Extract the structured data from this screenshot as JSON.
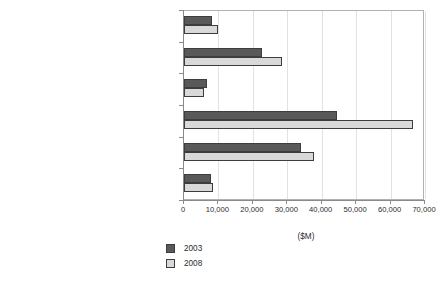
{
  "chart_data": {
    "type": "bar",
    "orientation": "horizontal",
    "title": "",
    "xlabel": "($M)",
    "ylabel": "",
    "xlim": [
      0,
      70000
    ],
    "xticks": [
      0,
      10000,
      20000,
      30000,
      40000,
      50000,
      60000,
      70000
    ],
    "xtick_labels": [
      "0",
      "10,000",
      "20,000",
      "30,000",
      "40,000",
      "50,000",
      "60,000",
      "70,000"
    ],
    "grid": true,
    "grid_axis": "x",
    "legend_position": "bottom-left",
    "categories": [
      "IS Consulting",
      "System Integration",
      "Custom Application Development",
      "Outsourcing",
      "Deploy & Support",
      "IT Education and Training"
    ],
    "series": [
      {
        "name": "2003",
        "color": "#595959",
        "values": [
          8000,
          22700,
          6700,
          44500,
          34000,
          7800
        ]
      },
      {
        "name": "2008",
        "color": "#d9d9d9",
        "values": [
          10000,
          28500,
          5700,
          66500,
          37800,
          8500
        ]
      }
    ]
  },
  "legend": {
    "items": [
      {
        "label": "2003",
        "swatch": "dark-gray-swatch"
      },
      {
        "label": "2008",
        "swatch": "light-gray-swatch"
      }
    ]
  },
  "axis": {
    "x_title": "($M)"
  }
}
